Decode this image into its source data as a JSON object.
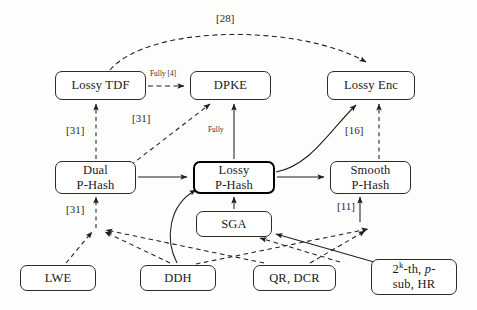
{
  "figure": {
    "type": "diagram",
    "background_color": "#fdfdfc",
    "node_border_color": "#2b2b2b",
    "emphasis_node_border_color": "#000000"
  },
  "nodes": [
    {
      "id": "lossy_tdf",
      "label_line1": "Lossy TDF",
      "label_line2": "",
      "x": 55,
      "y": 71,
      "w": 91,
      "h": 29,
      "emphasis": false
    },
    {
      "id": "dpke",
      "label_line1": "DPKE",
      "label_line2": "",
      "x": 190,
      "y": 71,
      "w": 81,
      "h": 29,
      "emphasis": false
    },
    {
      "id": "lossy_enc",
      "label_line1": "Lossy Enc",
      "label_line2": "",
      "x": 327,
      "y": 71,
      "w": 88,
      "h": 29,
      "emphasis": false
    },
    {
      "id": "dual_phash",
      "label_line1": "Dual",
      "label_line2": "P-Hash",
      "x": 55,
      "y": 161,
      "w": 81,
      "h": 33,
      "emphasis": false
    },
    {
      "id": "lossy_phash",
      "label_line1": "Lossy",
      "label_line2": "P-Hash",
      "x": 193,
      "y": 161,
      "w": 82,
      "h": 33,
      "emphasis": true
    },
    {
      "id": "smooth_phash",
      "label_line1": "Smooth",
      "label_line2": "P-Hash",
      "x": 330,
      "y": 161,
      "w": 81,
      "h": 33,
      "emphasis": false
    },
    {
      "id": "sga",
      "label_line1": "SGA",
      "label_line2": "",
      "x": 196,
      "y": 211,
      "w": 76,
      "h": 26,
      "emphasis": false
    },
    {
      "id": "lwe",
      "label_line1": "LWE",
      "label_line2": "",
      "x": 20,
      "y": 265,
      "w": 76,
      "h": 26,
      "emphasis": false
    },
    {
      "id": "ddh",
      "label_line1": "DDH",
      "label_line2": "",
      "x": 140,
      "y": 265,
      "w": 76,
      "h": 26,
      "emphasis": false
    },
    {
      "id": "qr_dcr",
      "label_line1": "QR, DCR",
      "label_line2": "",
      "x": 253,
      "y": 265,
      "w": 83,
      "h": 26,
      "emphasis": false
    },
    {
      "id": "pow_assump",
      "label_line1": "2^k-th, p-",
      "label_line2": "sub, HR",
      "x": 371,
      "y": 259,
      "w": 86,
      "h": 36,
      "emphasis": false
    }
  ],
  "edge_labels": [
    {
      "id": "cite_28",
      "text": "[28]",
      "x": 216,
      "y": 12,
      "size": "normal"
    },
    {
      "id": "fully_4",
      "text": "Fully [4]",
      "x": 150,
      "y": 70,
      "size": "tiny"
    },
    {
      "id": "cite_31_a",
      "text": "[31]",
      "x": 66,
      "y": 124,
      "size": "normal"
    },
    {
      "id": "cite_31_b",
      "text": "[31]",
      "x": 132,
      "y": 112,
      "size": "normal"
    },
    {
      "id": "fully",
      "text": "Fully",
      "x": 208,
      "y": 126,
      "size": "tiny"
    },
    {
      "id": "cite_16",
      "text": "[16]",
      "x": 345,
      "y": 124,
      "size": "normal"
    },
    {
      "id": "cite_31_c",
      "text": "[31]",
      "x": 66,
      "y": 203,
      "size": "normal"
    },
    {
      "id": "cite_11",
      "text": "[11]",
      "x": 337,
      "y": 200,
      "size": "normal"
    }
  ],
  "edges": [
    {
      "from": "lossy_tdf",
      "to": "lossy_enc",
      "style": "dashed",
      "label": "[28]"
    },
    {
      "from": "lossy_tdf",
      "to": "dpke",
      "style": "dashed",
      "label": "Fully [4]"
    },
    {
      "from": "dual_phash",
      "to": "lossy_tdf",
      "style": "dashed",
      "label": "[31]"
    },
    {
      "from": "dual_phash",
      "to": "dpke",
      "style": "dashed",
      "label": "[31]"
    },
    {
      "from": "lossy_phash",
      "to": "dpke",
      "style": "solid",
      "label": "Fully"
    },
    {
      "from": "lossy_phash",
      "to": "lossy_enc",
      "style": "solid",
      "label": ""
    },
    {
      "from": "smooth_phash",
      "to": "lossy_enc",
      "style": "dashed",
      "label": "[16]"
    },
    {
      "from": "dual_phash",
      "to": "lossy_phash",
      "style": "solid",
      "label": ""
    },
    {
      "from": "lossy_phash",
      "to": "smooth_phash",
      "style": "solid",
      "label": ""
    },
    {
      "from": "sga",
      "to": "lossy_phash",
      "style": "solid",
      "label": ""
    },
    {
      "from": "lwe",
      "to": "dual_phash",
      "style": "dashed",
      "label": "[31]"
    },
    {
      "from": "ddh",
      "to": "dual_phash",
      "style": "dashed",
      "label": ""
    },
    {
      "from": "ddh",
      "to": "lossy_phash",
      "style": "solid",
      "label": ""
    },
    {
      "from": "ddh",
      "to": "smooth_phash",
      "style": "dashed",
      "label": ""
    },
    {
      "from": "qr_dcr",
      "to": "dual_phash",
      "style": "dashed",
      "label": ""
    },
    {
      "from": "qr_dcr",
      "to": "smooth_phash",
      "style": "dashed",
      "label": "[11]"
    },
    {
      "from": "pow_assump",
      "to": "sga",
      "style": "solid",
      "label": ""
    },
    {
      "from": "pow_assump",
      "to": "smooth_phash",
      "style": "dashed",
      "label": ""
    }
  ]
}
